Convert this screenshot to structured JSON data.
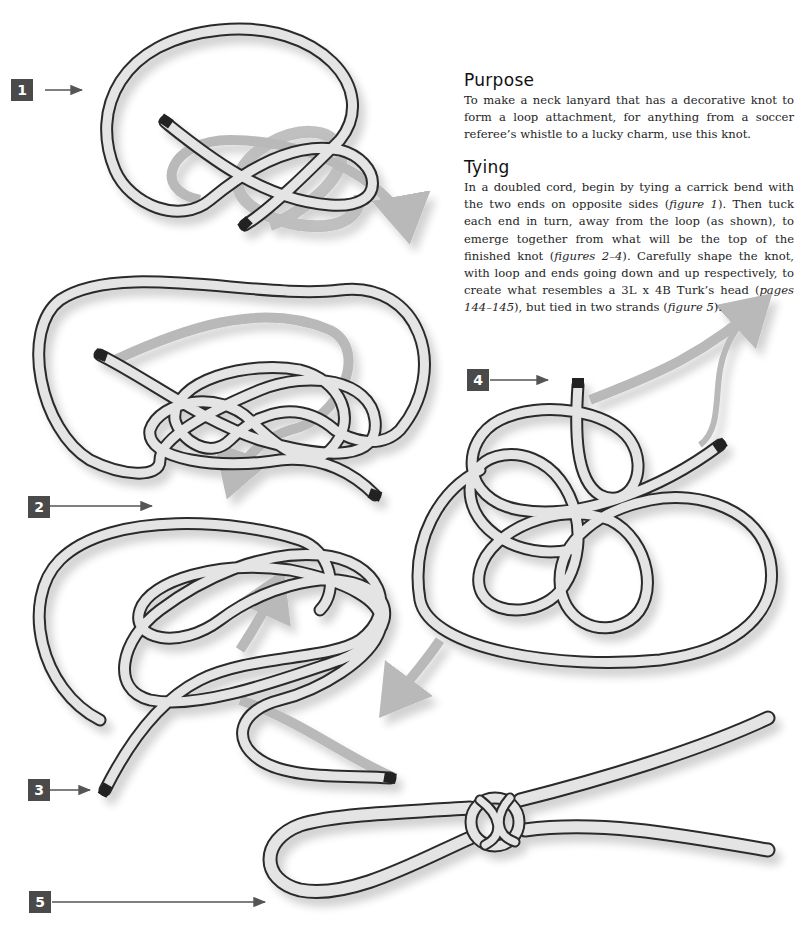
{
  "purpose": {
    "heading": "Purpose",
    "text": "To make a neck lanyard that has a decorative knot to form a loop attachment, for anything from a soccer referee’s whistle to a lucky charm, use this knot."
  },
  "tying": {
    "heading": "Tying",
    "segments": [
      {
        "t": "In a doubled cord, begin by tying a carrick bend with the two ends on opposite sides (",
        "i": false
      },
      {
        "t": "figure 1",
        "i": true
      },
      {
        "t": "). Then tuck each end in turn, away from the loop (as shown), to emerge together from what will be the top of the finished knot (",
        "i": false
      },
      {
        "t": "figures 2–4",
        "i": true
      },
      {
        "t": "). Carefully shape the knot, with loop and ends going down and up respectively, to create what resembles a 3L x 4B Turk’s head (",
        "i": false
      },
      {
        "t": "pages 144–145",
        "i": true
      },
      {
        "t": "), but tied in two strands (",
        "i": false
      },
      {
        "t": "figure 5",
        "i": true
      },
      {
        "t": ").",
        "i": false
      }
    ]
  },
  "figures": [
    {
      "label": "1",
      "description": "Carrick bend with ends on opposite sides"
    },
    {
      "label": "2",
      "description": "Tuck each end away from the loop"
    },
    {
      "label": "3",
      "description": "Ends emerge together"
    },
    {
      "label": "4",
      "description": "Top of knot forming"
    },
    {
      "label": "5",
      "description": "Finished lanyard knot with loop"
    }
  ],
  "colors": {
    "label_bg": "#4a4a4a",
    "cord_fill": "#e4e4e4",
    "cord_outline": "#2a2a2a",
    "arrow": "#b9b9b9",
    "pointer": "#555555"
  }
}
